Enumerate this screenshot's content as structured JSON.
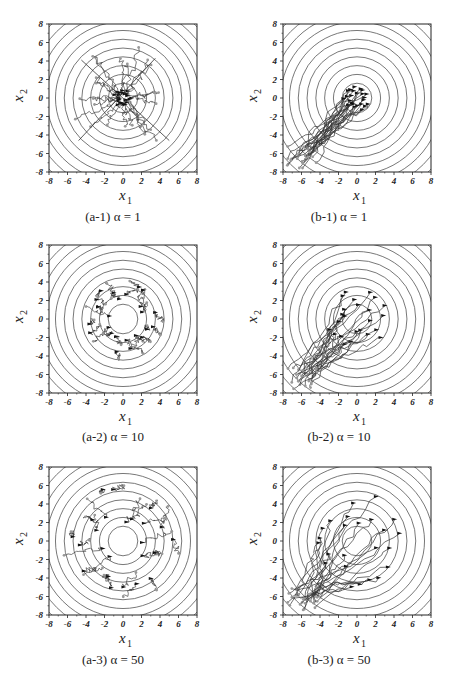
{
  "figure": {
    "panels": [
      {
        "id": "a-1",
        "caption": "(a-1) α = 1"
      },
      {
        "id": "b-1",
        "caption": "(b-1) α = 1"
      },
      {
        "id": "a-2",
        "caption": "(a-2) α = 10"
      },
      {
        "id": "b-2",
        "caption": "(b-2) α = 10"
      },
      {
        "id": "a-3",
        "caption": "(a-3) α = 50"
      },
      {
        "id": "b-3",
        "caption": "(b-3) α = 50"
      }
    ],
    "xlabel": "x",
    "xlabel_sub": "1",
    "ylabel": "x",
    "ylabel_sub": "2",
    "ticks": [
      "-8",
      "-6",
      "-4",
      "-2",
      "0",
      "2",
      "4",
      "6",
      "8"
    ]
  },
  "chart_data": [
    {
      "type": "line",
      "panel": "a-1",
      "title": "(a-1) α = 1",
      "xlabel": "x1",
      "ylabel": "x2",
      "xlim": [
        -8,
        8
      ],
      "ylim": [
        -8,
        8
      ],
      "background": "concentric circular contours centered at (0,0), spacing 1",
      "description": "Trajectories from start points within radius ~6 moving to cluster near origin; several straight diagonal lines through origin",
      "start_radius": 5,
      "end_radius": 1
    },
    {
      "type": "line",
      "panel": "b-1",
      "title": "(b-1) α = 1",
      "xlabel": "x1",
      "ylabel": "x2",
      "xlim": [
        -8,
        8
      ],
      "ylim": [
        -8,
        8
      ],
      "background": "concentric circular contours centered at (0,0)",
      "description": "Trajectories start near (-7,-7) corner and move diagonally to a cluster near origin (radius ~1.5)",
      "start_region": [
        -7,
        -7
      ],
      "end_radius": 1.5
    },
    {
      "type": "line",
      "panel": "a-2",
      "title": "(a-2) α = 10",
      "xlabel": "x1",
      "ylabel": "x2",
      "xlim": [
        -8,
        8
      ],
      "ylim": [
        -8,
        8
      ],
      "background": "concentric circular contours",
      "description": "Trajectories spread over ring up to radius ~4",
      "end_radius": 4
    },
    {
      "type": "line",
      "panel": "b-2",
      "title": "(b-2) α = 10",
      "xlabel": "x1",
      "ylabel": "x2",
      "xlim": [
        -8,
        8
      ],
      "ylim": [
        -8,
        8
      ],
      "background": "concentric circular contours",
      "description": "Trajectories start near (-7,-7) and fan out to ring around (0,0) radius ~3.5",
      "start_region": [
        -7,
        -7
      ],
      "end_radius": 3.5
    },
    {
      "type": "line",
      "panel": "a-3",
      "title": "(a-3) α = 50",
      "xlabel": "x1",
      "ylabel": "x2",
      "xlim": [
        -8,
        8
      ],
      "ylim": [
        -8,
        8
      ],
      "background": "concentric circular contours",
      "description": "Agents end spread over rings up to radius ~6",
      "end_radius": 6
    },
    {
      "type": "line",
      "panel": "b-3",
      "title": "(b-3) α = 50",
      "xlabel": "x1",
      "ylabel": "x2",
      "xlim": [
        -8,
        8
      ],
      "ylim": [
        -8,
        8
      ],
      "background": "concentric circular contours",
      "description": "Trajectories start near (-7,-7) and fan out to ring of radius ~5.5",
      "start_region": [
        -7,
        -7
      ],
      "end_radius": 5.5
    }
  ]
}
